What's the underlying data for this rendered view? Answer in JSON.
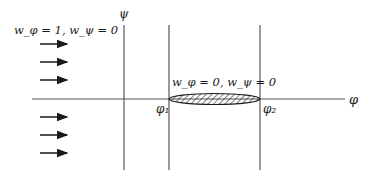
{
  "diagram": {
    "axes": {
      "horizontal_label": "φ",
      "vertical_label": "ψ"
    },
    "bounds": {
      "left_label": "φ₁",
      "right_label": "φ₂"
    },
    "inflow_condition": "w_φ = 1, w_ψ = 0",
    "obstacle_condition": "w_φ = 0, w_ψ = 0",
    "inflow_arrows_count": 6,
    "colors": {
      "line": "#3a3a3a",
      "hatch": "#2a2a2a",
      "background": "#ffffff"
    }
  }
}
